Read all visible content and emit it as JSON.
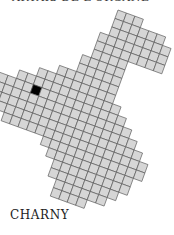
{
  "header": {
    "title": "ARTAIS DE L'ORGANE"
  },
  "map": {
    "label": "CHARNY",
    "cell_fill": "#d6d6d6",
    "cell_stroke": "#555555",
    "highlight_fill": "#000000",
    "cell_size": 9,
    "rotation_deg": 20,
    "origin": [
      118,
      10
    ],
    "rows": [
      [
        0,
        2
      ],
      [
        0,
        5
      ],
      [
        0,
        6
      ],
      [
        -1,
        6
      ],
      [
        -1,
        6
      ],
      [
        -1,
        2
      ],
      [
        -2,
        2
      ],
      [
        -2,
        2
      ],
      [
        -4,
        2
      ],
      [
        -6,
        2
      ],
      [
        -8,
        3
      ],
      [
        -10,
        4
      ],
      [
        -11,
        5
      ],
      [
        -12,
        6
      ],
      [
        -12,
        7
      ],
      [
        -8,
        8
      ],
      [
        -3,
        8
      ],
      [
        -2,
        7
      ],
      [
        -1,
        7
      ],
      [
        -1,
        6
      ],
      [
        0,
        5
      ],
      [
        0,
        3
      ]
    ],
    "highlight": [
      [
        11,
        -6
      ]
    ]
  }
}
